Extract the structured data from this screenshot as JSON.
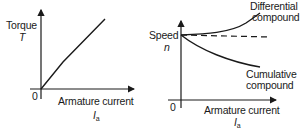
{
  "left_chart": {
    "y_label": "Torque",
    "y_symbol": "T",
    "origin_label": "0",
    "x_label": "Armature current",
    "x_symbol": "I",
    "x_symbol_sub": "a"
  },
  "right_chart": {
    "y_label": "Speed",
    "y_symbol": "n",
    "origin_label": "0",
    "x_label": "Armature current",
    "x_symbol": "I",
    "x_symbol_sub": "a",
    "curves": [
      {
        "name": "Differential compound",
        "line1": "Differential",
        "line2": "compound",
        "style": "solid",
        "trend": "rising"
      },
      {
        "name": "Shunt (reference)",
        "style": "dashed",
        "trend": "flat"
      },
      {
        "name": "Cumulative compound",
        "line1": "Cumulative",
        "line2": "compound",
        "style": "solid",
        "trend": "falling"
      }
    ]
  },
  "colors": {
    "ink": "#1a1a1a",
    "background": "#ffffff"
  }
}
